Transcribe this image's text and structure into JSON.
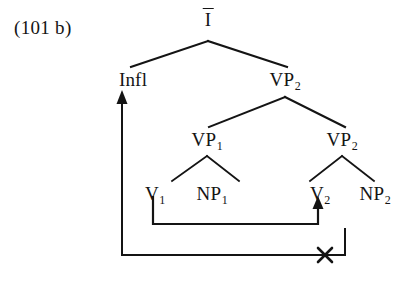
{
  "figure": {
    "example_label": "(101 b)",
    "kind": "syntactic-tree-diagram",
    "ink_color": "#141414",
    "background_color": "#ffffff"
  },
  "nodes": {
    "root": {
      "label": "I",
      "has_overbar": true,
      "x": 208,
      "y": 20
    },
    "infl": {
      "label": "Infl",
      "x": 133,
      "y": 75
    },
    "vp2_upper": {
      "label": "VP",
      "subscript": "2",
      "x": 285,
      "y": 75
    },
    "vp1": {
      "label": "VP",
      "subscript": "1",
      "x": 207,
      "y": 135
    },
    "vp2_lower": {
      "label": "VP",
      "subscript": "2",
      "x": 342,
      "y": 135
    },
    "v1": {
      "label": "V",
      "subscript": "1",
      "x": 155,
      "y": 189
    },
    "np1": {
      "label": "NP",
      "subscript": "1",
      "x": 212,
      "y": 189
    },
    "v2": {
      "label": "V",
      "subscript": "2",
      "x": 320,
      "y": 189
    },
    "np2": {
      "label": "NP",
      "subscript": "2",
      "x": 375,
      "y": 189
    }
  },
  "movement_arrows": [
    {
      "name": "v1-to-v2-movement",
      "from": "V1",
      "to": "V2",
      "blocked": false
    },
    {
      "name": "v2-to-infl-movement",
      "from": "V2",
      "to": "Infl",
      "blocked": true,
      "block_marker": "x"
    }
  ]
}
